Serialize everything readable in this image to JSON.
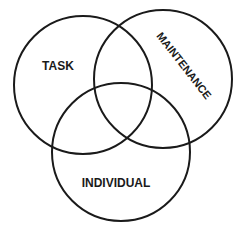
{
  "diagram": {
    "type": "venn",
    "circles": [
      {
        "id": "task",
        "label": "TASK",
        "cx": 83,
        "cy": 85,
        "r": 69
      },
      {
        "id": "maintenance",
        "label": "MAINTENANCE",
        "cx": 163,
        "cy": 79,
        "r": 69
      },
      {
        "id": "individual",
        "label": "INDIVIDUAL",
        "cx": 121,
        "cy": 152,
        "r": 69
      }
    ],
    "stroke_color": "#1a1a1a",
    "background": "#ffffff"
  }
}
